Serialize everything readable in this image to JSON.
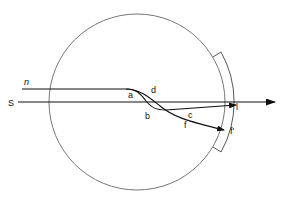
{
  "diagram": {
    "title": "",
    "labels": {
      "n": "n",
      "s": "S",
      "a": "a",
      "b": "b",
      "c": "c",
      "d": "d",
      "f_mid": "f",
      "l": "l",
      "f_end": "f'"
    },
    "colors": {
      "line": "#111111",
      "circle": "#555555",
      "background": "#ffffff"
    }
  }
}
